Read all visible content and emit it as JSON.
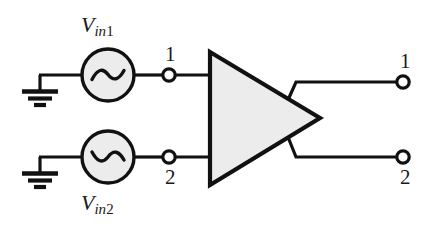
{
  "figure": {
    "background_color": "#ffffff",
    "line_color": "#111111",
    "fill_color": "#ececec"
  },
  "sources": [
    {
      "id": "vin1",
      "symbol": "ac-voltage-source",
      "label_v": "V",
      "label_sub_in": "in",
      "label_sub_num": "1",
      "label_full": "Vin1",
      "waveform": "sine",
      "waveform_phase": "normal"
    },
    {
      "id": "vin2",
      "symbol": "ac-voltage-source",
      "label_v": "V",
      "label_sub_in": "in",
      "label_sub_num": "2",
      "label_full": "Vin2",
      "waveform": "sine",
      "waveform_phase": "inverted"
    }
  ],
  "grounds": [
    {
      "id": "gnd1",
      "symbol": "ground"
    },
    {
      "id": "gnd2",
      "symbol": "ground"
    }
  ],
  "amplifier": {
    "symbol": "triangle-amplifier",
    "fill": "#ececec",
    "stroke": "#111111"
  },
  "terminals": {
    "input_1": "1",
    "input_2": "2",
    "output_1": "1",
    "output_2": "2"
  }
}
